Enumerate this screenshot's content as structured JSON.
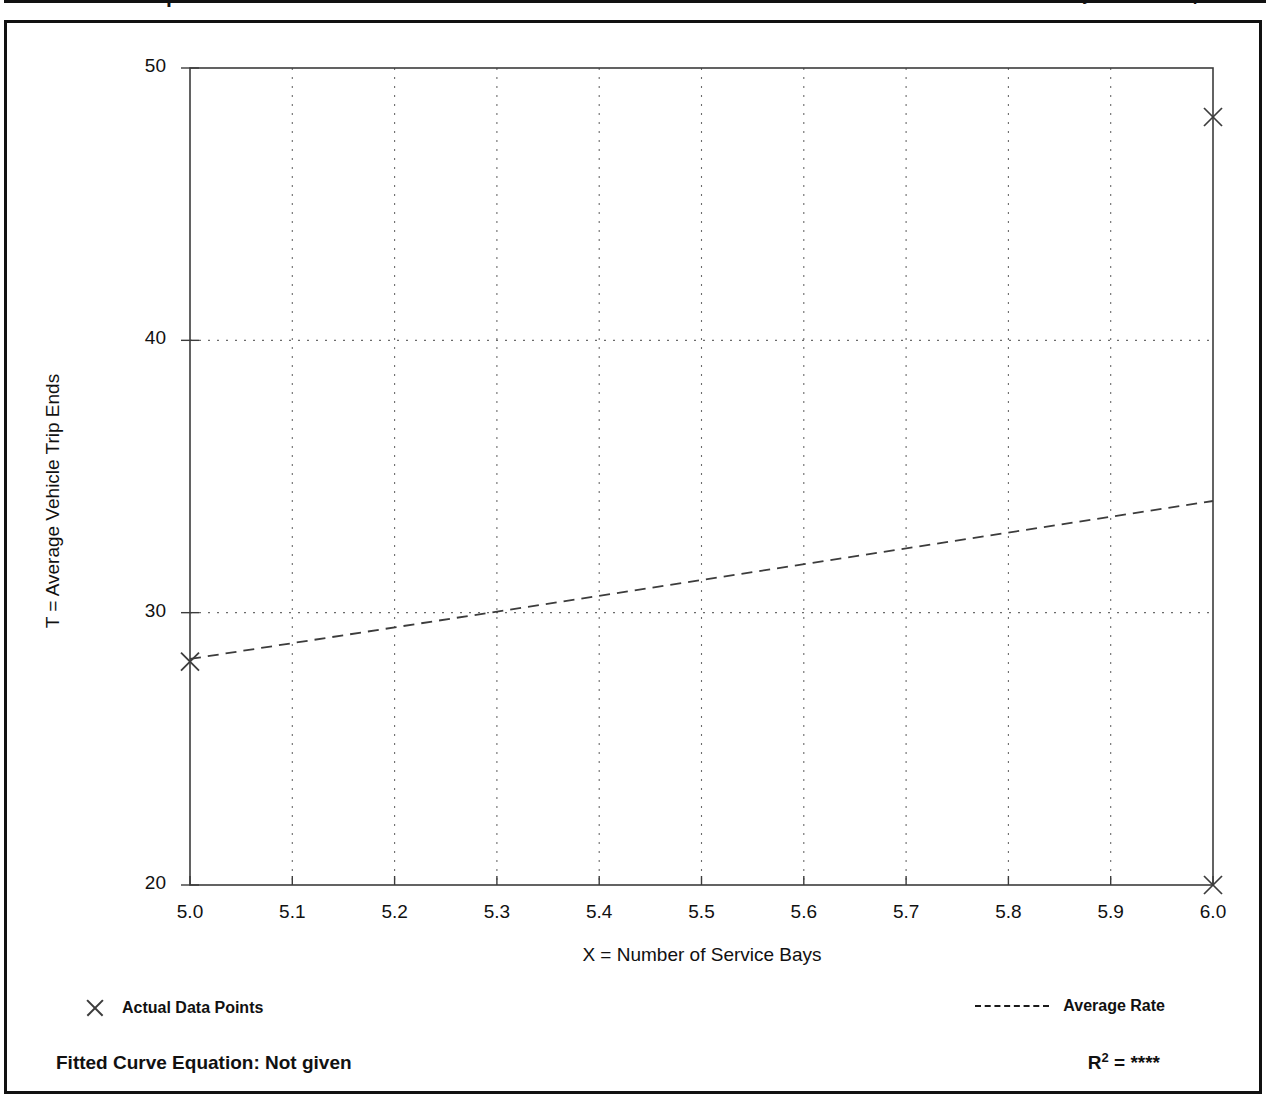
{
  "header": {
    "title": "Data Plot and Equation",
    "caution": "Caution - Use Carefully - Small Sample Size"
  },
  "legend": {
    "data_points_label": "Actual Data Points",
    "data_points_icon": "x-marker-icon",
    "average_rate_label": "Average Rate",
    "average_rate_icon": "dashed-line-icon"
  },
  "footer": {
    "fitted_curve_label": "Fitted Curve Equation:  Not given",
    "r_squared_prefix": "R",
    "r_squared_exponent": "2",
    "r_squared_value": "= ****"
  },
  "colors": {
    "frame": "#111111",
    "axis": "#3c3c3c",
    "grid": "#6b6b6b",
    "series": "#3c3c3c",
    "background": "#ffffff"
  },
  "chart_data": {
    "type": "scatter",
    "title": "Data Plot and Equation",
    "xlabel": "X = Number of Service Bays",
    "ylabel": "T = Average Vehicle Trip Ends",
    "xlim": [
      5.0,
      6.0
    ],
    "ylim": [
      20,
      50
    ],
    "xticks": [
      "5.0",
      "5.1",
      "5.2",
      "5.3",
      "5.4",
      "5.5",
      "5.6",
      "5.7",
      "5.8",
      "5.9",
      "6.0"
    ],
    "xtick_values": [
      5.0,
      5.1,
      5.2,
      5.3,
      5.4,
      5.5,
      5.6,
      5.7,
      5.8,
      5.9,
      6.0
    ],
    "yticks": [
      "20",
      "30",
      "40",
      "50"
    ],
    "ytick_values": [
      20,
      30,
      40,
      50
    ],
    "grid": true,
    "grid_style": "dotted",
    "legend_position": "below-axes",
    "series": [
      {
        "name": "Actual Data Points",
        "type": "scatter",
        "marker": "x",
        "points": [
          {
            "x": 5.0,
            "y": 28.2
          },
          {
            "x": 6.0,
            "y": 48.2
          },
          {
            "x": 6.0,
            "y": 20.0
          }
        ]
      },
      {
        "name": "Average Rate",
        "type": "line",
        "style": "dashed",
        "points": [
          {
            "x": 5.0,
            "y": 28.3
          },
          {
            "x": 6.0,
            "y": 34.1
          }
        ]
      }
    ],
    "annotations": {
      "fitted_curve_equation": "Not given",
      "r_squared": "****"
    }
  }
}
